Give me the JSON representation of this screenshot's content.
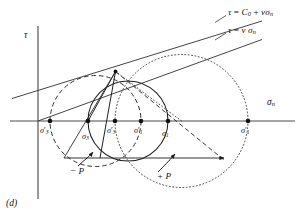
{
  "figure": {
    "caption": "(d)",
    "axes": {
      "y_label": "τ",
      "x_label_base": "σ",
      "x_label_sub": "n"
    },
    "equations": [
      {
        "id": "failure-envelope",
        "parts": {
          "tau": "τ",
          "eq": "=",
          "c0_base": "C",
          "c0_sub": "0",
          "plus": "+",
          "nu": "ν",
          "sigma_base": "σ",
          "sigma_sub": "n"
        },
        "text": "τ = C0 + νσn"
      },
      {
        "id": "sliding-friction-line",
        "parts": {
          "tau": "τ",
          "eq": "=",
          "nu": "ν",
          "sigma_base": "σ",
          "sigma_sub": "n"
        },
        "text": "τ = ν σn"
      }
    ],
    "axis_points": [
      {
        "id": "sigma3-prime-left",
        "base": "σ",
        "prime": "′",
        "sub": "3",
        "x": 50,
        "label_x": 40,
        "label_y": 127
      },
      {
        "id": "sigma3-solid",
        "base": "σ",
        "prime": "",
        "sub": "3",
        "x": 88,
        "label_x": 82,
        "label_y": 133
      },
      {
        "id": "sigma3-prime-mid",
        "base": "σ",
        "prime": "′",
        "sub": "3",
        "x": 115,
        "label_x": 107,
        "label_y": 127
      },
      {
        "id": "sigma1-prime-mid",
        "base": "σ",
        "prime": "′",
        "sub": "1",
        "x": 141,
        "label_x": 134,
        "label_y": 127
      },
      {
        "id": "sigma1-solid",
        "base": "σ",
        "prime": "",
        "sub": "1",
        "x": 168,
        "label_x": 162,
        "label_y": 130
      },
      {
        "id": "sigma1-prime-right",
        "base": "σ",
        "prime": "′",
        "sub": "1",
        "x": 248,
        "label_x": 241,
        "label_y": 127
      }
    ],
    "annotations": [
      {
        "id": "minus-p",
        "text": "− P",
        "x": 73,
        "y": 171
      },
      {
        "id": "plus-p",
        "text": "+ P",
        "x": 160,
        "y": 176
      }
    ],
    "circles": [
      {
        "id": "dashed-circle",
        "style": "dashed",
        "center_x": 95.5,
        "radius": 45.5,
        "sigma3": 50,
        "sigma1": 141
      },
      {
        "id": "solid-circle",
        "style": "solid",
        "center_x": 128.0,
        "radius": 40.0,
        "sigma3": 88,
        "sigma1": 168
      },
      {
        "id": "dotted-circle",
        "style": "dotted",
        "center_x": 181.5,
        "radius": 66.5,
        "sigma3": 115,
        "sigma1": 248
      }
    ],
    "colors": {
      "ink": "#1a1a1a",
      "axis": "#555555",
      "background": "#ffffff"
    }
  }
}
